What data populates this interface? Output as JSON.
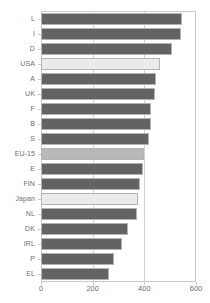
{
  "chart_data": {
    "type": "bar",
    "orientation": "horizontal",
    "title": "",
    "subtitle": "",
    "xlabel": "",
    "ylabel": "",
    "grid": true,
    "legend": "none",
    "xlim": [
      0,
      600
    ],
    "xticks": [
      0,
      200,
      400,
      600
    ],
    "xtick_labels": [
      "0",
      "200",
      "400",
      "600"
    ],
    "categories": [
      "L",
      "I",
      "D",
      "USA",
      "A",
      "UK",
      "F",
      "B",
      "S",
      "EU-15",
      "E",
      "FIN",
      "Japan",
      "NL",
      "DK",
      "IRL",
      "P",
      "EL"
    ],
    "values": [
      545,
      540,
      508,
      462,
      446,
      442,
      427,
      427,
      419,
      400,
      396,
      385,
      377,
      373,
      335,
      312,
      281,
      265
    ],
    "bars": [
      {
        "label": "L",
        "value": 545,
        "highlight": "dark"
      },
      {
        "label": "I",
        "value": 540,
        "highlight": "dark"
      },
      {
        "label": "D",
        "value": 508,
        "highlight": "dark"
      },
      {
        "label": "USA",
        "value": 462,
        "highlight": "lightest"
      },
      {
        "label": "A",
        "value": 446,
        "highlight": "dark"
      },
      {
        "label": "UK",
        "value": 442,
        "highlight": "dark"
      },
      {
        "label": "F",
        "value": 427,
        "highlight": "dark"
      },
      {
        "label": "B",
        "value": 427,
        "highlight": "dark"
      },
      {
        "label": "S",
        "value": 419,
        "highlight": "dark"
      },
      {
        "label": "EU-15",
        "value": 400,
        "highlight": "medium"
      },
      {
        "label": "E",
        "value": 396,
        "highlight": "dark"
      },
      {
        "label": "FIN",
        "value": 385,
        "highlight": "dark"
      },
      {
        "label": "Japan",
        "value": 377,
        "highlight": "lightest"
      },
      {
        "label": "NL",
        "value": 373,
        "highlight": "dark"
      },
      {
        "label": "DK",
        "value": 335,
        "highlight": "dark"
      },
      {
        "label": "IRL",
        "value": 312,
        "highlight": "dark"
      },
      {
        "label": "P",
        "value": 281,
        "highlight": "dark"
      },
      {
        "label": "EL",
        "value": 265,
        "highlight": "dark"
      }
    ]
  },
  "colors": {
    "bar_dark": "#636363",
    "bar_medium": "#b9b9b9",
    "bar_lightest": "#ebebeb",
    "bar_border": "#b4b4b4",
    "axis_line": "#c9c9c9",
    "gridline": "#d2d2d2",
    "tick_text": "#6d6d6d",
    "background": "#ffffff"
  }
}
